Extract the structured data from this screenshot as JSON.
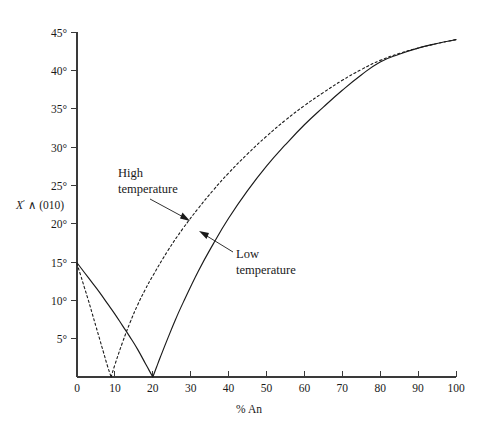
{
  "figure": {
    "name": "extinction-angle-vs-anorthite-plot",
    "background_color": "#ffffff",
    "line_color": "#1a1a1a"
  },
  "axes": {
    "y_label_symbol": "X",
    "y_label_prime": "′",
    "y_label_rest": " ∧ (010)",
    "y_label_full": "X′ ∧ (010)",
    "x_label": "% An",
    "y_ticks": [
      "5°",
      "10°",
      "15°",
      "20°",
      "25°",
      "30°",
      "35°",
      "40°",
      "45°"
    ],
    "x_ticks": [
      "0",
      "10",
      "20",
      "30",
      "40",
      "50",
      "60",
      "70",
      "80",
      "90",
      "100"
    ]
  },
  "annotations": [
    {
      "name": "high-temperature-label",
      "line1": "High",
      "line2": "temperature"
    },
    {
      "name": "low-temperature-label",
      "line1": "Low",
      "line2": "temperature"
    }
  ],
  "chart_data": {
    "type": "line",
    "title": "",
    "xlabel": "% An",
    "ylabel": "X′ ∧ (010)",
    "xlim": [
      0,
      100
    ],
    "ylim": [
      0,
      45
    ],
    "xticks": [
      0,
      10,
      20,
      30,
      40,
      50,
      60,
      70,
      80,
      90,
      100
    ],
    "yticks": [
      0,
      5,
      10,
      15,
      20,
      25,
      30,
      35,
      40,
      45
    ],
    "ytick_labels": [
      "",
      "5°",
      "10°",
      "15°",
      "20°",
      "25°",
      "30°",
      "35°",
      "40°",
      "45°"
    ],
    "grid": false,
    "legend": "annotated-inline",
    "series": [
      {
        "name": "High temperature",
        "style": "dashed",
        "x": [
          0,
          1,
          2,
          3,
          4,
          5,
          6,
          7,
          8,
          9,
          10,
          12,
          14,
          16,
          18,
          20,
          24,
          28,
          32,
          36,
          40,
          45,
          50,
          55,
          60,
          65,
          70,
          75,
          80,
          85,
          90,
          95,
          100
        ],
        "y": [
          14.8,
          13.2,
          11.6,
          10.0,
          8.3,
          6.6,
          4.9,
          3.2,
          1.5,
          0.0,
          1.6,
          4.5,
          7.1,
          9.4,
          11.4,
          13.2,
          16.5,
          19.4,
          22.0,
          24.4,
          26.6,
          29.1,
          31.4,
          33.5,
          35.4,
          37.1,
          38.7,
          40.1,
          41.3,
          42.2,
          42.9,
          43.5,
          44.0
        ]
      },
      {
        "name": "Low temperature",
        "style": "solid",
        "x": [
          0,
          2,
          4,
          6,
          8,
          10,
          12,
          14,
          16,
          18,
          19,
          20,
          21,
          22,
          24,
          26,
          28,
          32,
          36,
          40,
          45,
          50,
          55,
          60,
          65,
          70,
          75,
          80,
          85,
          90,
          95,
          100
        ],
        "y": [
          14.9,
          13.6,
          12.3,
          11.0,
          9.6,
          8.2,
          6.7,
          5.2,
          3.6,
          1.8,
          0.9,
          0.0,
          1.3,
          2.6,
          5.1,
          7.5,
          9.7,
          13.8,
          17.4,
          20.7,
          24.3,
          27.5,
          30.3,
          32.9,
          35.2,
          37.4,
          39.4,
          41.1,
          42.1,
          42.9,
          43.5,
          44.0
        ]
      }
    ]
  }
}
